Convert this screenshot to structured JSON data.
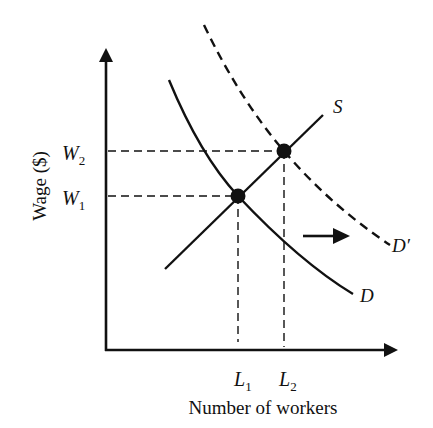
{
  "diagram": {
    "type": "labor-market-supply-demand",
    "axes": {
      "y_label": "Wage ($)",
      "x_label": "Number of workers"
    },
    "y_ticks": [
      {
        "main": "W",
        "sub": "2",
        "y": 151
      },
      {
        "main": "W",
        "sub": "1",
        "y": 196
      }
    ],
    "x_ticks": [
      {
        "main": "L",
        "sub": "1",
        "x": 238
      },
      {
        "main": "L",
        "sub": "2",
        "x": 284
      }
    ],
    "curves": {
      "supply": {
        "label": "S",
        "style": "solid"
      },
      "demand": {
        "label": "D",
        "style": "solid"
      },
      "demand_shifted": {
        "label": "D′",
        "style": "dashed"
      }
    },
    "equilibria": [
      {
        "name": "initial",
        "wage": "W1",
        "labor": "L1"
      },
      {
        "name": "new",
        "wage": "W2",
        "labor": "L2"
      }
    ],
    "shift_arrow": {
      "direction": "right",
      "meaning": "demand increases"
    },
    "colors": {
      "ink": "#111111",
      "background": "#ffffff"
    }
  }
}
